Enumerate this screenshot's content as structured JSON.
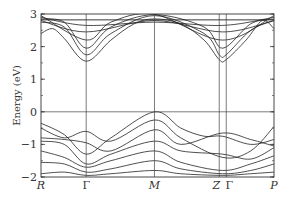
{
  "chart_data": {
    "type": "line",
    "title": "",
    "xlabel": "",
    "ylabel": "Energy (eV)",
    "ylim": [
      -2,
      3
    ],
    "yticks": [
      3,
      2,
      1,
      0,
      -1,
      -2
    ],
    "ytick_labels": [
      "3",
      "2",
      "1",
      "0",
      "−1",
      "−2"
    ],
    "kpath": [
      {
        "label": "R",
        "italic": true,
        "pos": 0.0
      },
      {
        "label": "Γ",
        "italic": false,
        "pos": 0.194
      },
      {
        "label": "M",
        "italic": true,
        "pos": 0.487
      },
      {
        "label": "Z",
        "italic": true,
        "pos": 0.765
      },
      {
        "label": "Γ",
        "italic": false,
        "pos": 0.795
      },
      {
        "label": "P",
        "italic": true,
        "pos": 1.0
      }
    ],
    "fermi_level": 0,
    "grid": false,
    "legend": null,
    "annotations": {
      "conduction_band_minimum": {
        "k": "Γ",
        "energy": 1.55
      },
      "valence_band_maximum": {
        "k": "M",
        "energy": 0.0
      },
      "band_gap_approx_eV": 1.55
    },
    "series": [
      {
        "name": "conduction-band-1",
        "points": [
          [
            0.0,
            2.4
          ],
          [
            0.05,
            2.55
          ],
          [
            0.1,
            2.25
          ],
          [
            0.194,
            1.55
          ],
          [
            0.3,
            2.2
          ],
          [
            0.4,
            2.7
          ],
          [
            0.487,
            2.85
          ],
          [
            0.6,
            2.7
          ],
          [
            0.7,
            2.2
          ],
          [
            0.765,
            1.6
          ],
          [
            0.795,
            1.6
          ],
          [
            0.88,
            2.2
          ],
          [
            0.95,
            2.8
          ],
          [
            1.0,
            2.55
          ]
        ]
      },
      {
        "name": "conduction-band-2",
        "points": [
          [
            0.0,
            2.75
          ],
          [
            0.1,
            2.6
          ],
          [
            0.194,
            1.75
          ],
          [
            0.3,
            2.4
          ],
          [
            0.487,
            2.95
          ],
          [
            0.7,
            2.4
          ],
          [
            0.765,
            1.75
          ],
          [
            0.795,
            1.75
          ],
          [
            0.9,
            2.5
          ],
          [
            1.0,
            2.8
          ]
        ]
      },
      {
        "name": "conduction-band-3",
        "points": [
          [
            0.0,
            2.85
          ],
          [
            0.1,
            2.75
          ],
          [
            0.194,
            1.95
          ],
          [
            0.3,
            2.6
          ],
          [
            0.487,
            2.98
          ],
          [
            0.7,
            2.6
          ],
          [
            0.78,
            1.95
          ],
          [
            0.9,
            2.7
          ],
          [
            1.0,
            2.85
          ]
        ]
      },
      {
        "name": "conduction-band-4",
        "points": [
          [
            0.0,
            2.95
          ],
          [
            0.194,
            2.2
          ],
          [
            0.3,
            2.75
          ],
          [
            0.487,
            2.99
          ],
          [
            0.78,
            2.2
          ],
          [
            1.0,
            2.95
          ]
        ]
      },
      {
        "name": "conduction-band-5",
        "points": [
          [
            0.0,
            2.8
          ],
          [
            0.194,
            2.45
          ],
          [
            0.487,
            2.8
          ],
          [
            0.78,
            2.45
          ],
          [
            1.0,
            2.8
          ]
        ]
      },
      {
        "name": "conduction-band-6",
        "points": [
          [
            0.0,
            2.9
          ],
          [
            0.194,
            2.65
          ],
          [
            0.487,
            2.75
          ],
          [
            0.78,
            2.65
          ],
          [
            1.0,
            2.9
          ]
        ]
      },
      {
        "name": "valence-band-1",
        "points": [
          [
            0.0,
            -0.35
          ],
          [
            0.1,
            -0.7
          ],
          [
            0.194,
            -1.3
          ],
          [
            0.3,
            -0.8
          ],
          [
            0.487,
            0.0
          ],
          [
            0.6,
            -0.5
          ],
          [
            0.7,
            -0.75
          ],
          [
            0.78,
            -0.75
          ],
          [
            0.9,
            -1.0
          ],
          [
            1.0,
            -0.85
          ]
        ]
      },
      {
        "name": "valence-band-2",
        "points": [
          [
            0.0,
            -0.5
          ],
          [
            0.1,
            -0.8
          ],
          [
            0.194,
            -0.6
          ],
          [
            0.3,
            -0.9
          ],
          [
            0.487,
            -0.25
          ],
          [
            0.6,
            -0.8
          ],
          [
            0.78,
            -1.4
          ],
          [
            0.9,
            -1.2
          ],
          [
            1.0,
            -0.45
          ]
        ]
      },
      {
        "name": "valence-band-3",
        "points": [
          [
            0.0,
            -0.8
          ],
          [
            0.1,
            -0.85
          ],
          [
            0.194,
            -0.95
          ],
          [
            0.3,
            -1.2
          ],
          [
            0.487,
            -0.55
          ],
          [
            0.6,
            -1.0
          ],
          [
            0.78,
            -0.65
          ],
          [
            0.9,
            -0.85
          ],
          [
            1.0,
            -1.05
          ]
        ]
      },
      {
        "name": "valence-band-4",
        "points": [
          [
            0.0,
            -0.9
          ],
          [
            0.1,
            -1.0
          ],
          [
            0.194,
            -1.6
          ],
          [
            0.3,
            -1.3
          ],
          [
            0.487,
            -0.9
          ],
          [
            0.6,
            -1.2
          ],
          [
            0.78,
            -1.3
          ],
          [
            0.9,
            -1.45
          ],
          [
            1.0,
            -1.1
          ]
        ]
      },
      {
        "name": "valence-band-5",
        "points": [
          [
            0.0,
            -1.2
          ],
          [
            0.1,
            -1.4
          ],
          [
            0.194,
            -1.7
          ],
          [
            0.3,
            -1.5
          ],
          [
            0.487,
            -1.2
          ],
          [
            0.6,
            -1.55
          ],
          [
            0.78,
            -1.8
          ],
          [
            0.9,
            -1.6
          ],
          [
            1.0,
            -1.35
          ]
        ]
      },
      {
        "name": "valence-band-6",
        "points": [
          [
            0.0,
            -1.55
          ],
          [
            0.1,
            -1.6
          ],
          [
            0.194,
            -1.85
          ],
          [
            0.3,
            -1.75
          ],
          [
            0.487,
            -1.5
          ],
          [
            0.6,
            -1.75
          ],
          [
            0.78,
            -1.9
          ],
          [
            0.9,
            -1.8
          ],
          [
            1.0,
            -1.6
          ]
        ]
      },
      {
        "name": "valence-band-7",
        "points": [
          [
            0.0,
            -1.9
          ],
          [
            0.1,
            -1.85
          ],
          [
            0.194,
            -1.95
          ],
          [
            0.3,
            -1.9
          ],
          [
            0.487,
            -1.8
          ],
          [
            0.6,
            -1.9
          ],
          [
            0.78,
            -1.95
          ],
          [
            0.9,
            -1.9
          ],
          [
            1.0,
            -1.85
          ]
        ]
      }
    ]
  }
}
